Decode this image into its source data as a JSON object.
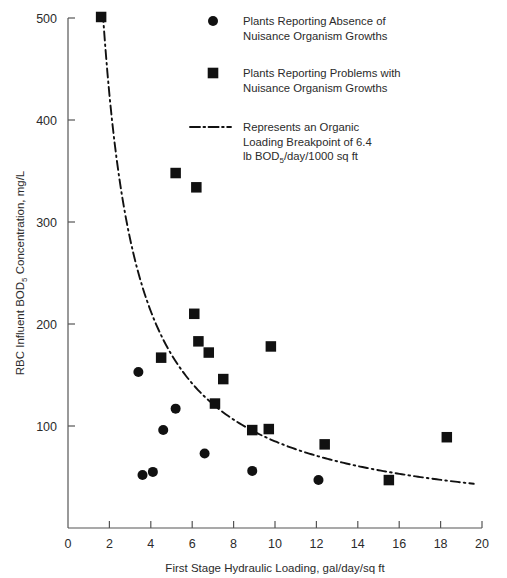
{
  "chart_data": {
    "type": "scatter",
    "title": "",
    "xlabel": "First Stage Hydraulic Loading, gal/day/sq ft",
    "ylabel_parts": {
      "pre": "RBC Influent BOD",
      "sub": "5",
      "post": " Concentration, mg/L"
    },
    "ylabel": "RBC Influent BOD5 Concentration, mg/L",
    "xlim": [
      0,
      20
    ],
    "ylim": [
      0,
      520
    ],
    "xticks": [
      0,
      2,
      4,
      6,
      8,
      10,
      12,
      14,
      16,
      18,
      20
    ],
    "yticks": [
      100,
      200,
      300,
      400,
      500
    ],
    "grid": false,
    "legend_position": "top-right",
    "series": [
      {
        "name": "Plants Reporting Absence of Nuisance Organism Growths",
        "marker": "circle",
        "color": "#111111",
        "points": [
          {
            "x": 3.4,
            "y": 153
          },
          {
            "x": 3.6,
            "y": 52
          },
          {
            "x": 4.1,
            "y": 55
          },
          {
            "x": 4.6,
            "y": 96
          },
          {
            "x": 5.2,
            "y": 117
          },
          {
            "x": 6.6,
            "y": 73
          },
          {
            "x": 8.9,
            "y": 56
          },
          {
            "x": 12.1,
            "y": 47
          }
        ]
      },
      {
        "name": "Plants Reporting Problems with Nuisance Organism Growths",
        "marker": "square",
        "color": "#111111",
        "points": [
          {
            "x": 1.6,
            "y": 501
          },
          {
            "x": 5.2,
            "y": 348
          },
          {
            "x": 6.2,
            "y": 334
          },
          {
            "x": 4.5,
            "y": 167
          },
          {
            "x": 6.1,
            "y": 210
          },
          {
            "x": 6.3,
            "y": 183
          },
          {
            "x": 6.8,
            "y": 172
          },
          {
            "x": 7.5,
            "y": 146
          },
          {
            "x": 7.1,
            "y": 122
          },
          {
            "x": 8.9,
            "y": 96
          },
          {
            "x": 9.7,
            "y": 97
          },
          {
            "x": 9.8,
            "y": 178
          },
          {
            "x": 12.4,
            "y": 82
          },
          {
            "x": 15.5,
            "y": 47
          },
          {
            "x": 18.3,
            "y": 89
          }
        ]
      }
    ],
    "breakpoint_curve": {
      "name": "Represents an Organic Loading Breakpoint of 6.4 lb BOD5/day/1000 sq ft",
      "formula_constant": 850,
      "x_start": 1.68,
      "x_end": 19.6,
      "style": "dash-dot"
    }
  },
  "legend": {
    "items": [
      {
        "marker": "circle",
        "line1": "Plants Reporting Absence of",
        "line2": "Nuisance Organism Growths",
        "line3": "",
        "line4": ""
      },
      {
        "marker": "square",
        "line1": "Plants Reporting Problems with",
        "line2": "Nuisance Organism Growths",
        "line3": "",
        "line4": ""
      },
      {
        "marker": "dash-dot-line",
        "line1": "Represents an Organic",
        "line2": "Loading Breakpoint of 6.4",
        "line3_pre": "lb BOD",
        "line3_sub": "5",
        "line3_post": "/day/1000 sq ft"
      }
    ]
  },
  "axes": {
    "x_title": "First Stage Hydraulic Loading, gal/day/sq ft",
    "y_title_pre": "RBC Influent BOD",
    "y_title_sub": "5",
    "y_title_post": " Concentration, mg/L",
    "x_tick_labels": [
      "0",
      "2",
      "4",
      "6",
      "8",
      "10",
      "12",
      "14",
      "16",
      "18",
      "20"
    ],
    "y_tick_labels": [
      "100",
      "200",
      "300",
      "400",
      "500"
    ]
  }
}
